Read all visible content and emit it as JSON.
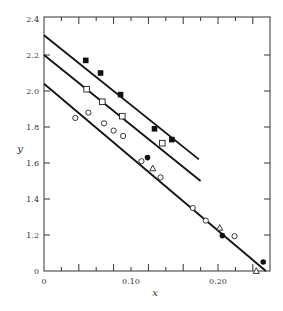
{
  "chart_data": {
    "type": "scatter",
    "title": "",
    "xlabel": "x",
    "ylabel": "y",
    "xlim": [
      0,
      0.26
    ],
    "ylim": [
      0,
      2.4
    ],
    "y_axis_break": {
      "from": 0,
      "to": 1.2,
      "note": "axis jumps from 0 directly to 1.2"
    },
    "grid": false,
    "legend": null,
    "x_ticks": {
      "major_labeled": [
        0,
        0.1,
        0.2
      ],
      "major_labels": [
        "0",
        "0.10",
        "0.20"
      ],
      "major_unlabeled": [
        0.04,
        0.08,
        0.12,
        0.16,
        0.24
      ],
      "minor_step": 0.02
    },
    "y_ticks": {
      "values": [
        0,
        1.2,
        1.4,
        1.6,
        1.8,
        2.0,
        2.2,
        2.4
      ],
      "labels": [
        "0",
        "1.2",
        "1.4",
        "1.6",
        "1.8",
        "2.0",
        "2.2",
        "2.4"
      ]
    },
    "series": [
      {
        "name": "filled-squares",
        "marker": "square-filled",
        "x": [
          0.048,
          0.065,
          0.088,
          0.127,
          0.147
        ],
        "y": [
          2.17,
          2.1,
          1.98,
          1.79,
          1.73
        ]
      },
      {
        "name": "open-squares",
        "marker": "square-open",
        "x": [
          0.049,
          0.067,
          0.09,
          0.136
        ],
        "y": [
          2.01,
          1.94,
          1.86,
          1.71
        ]
      },
      {
        "name": "open-circles",
        "marker": "circle-open",
        "x": [
          0.036,
          0.051,
          0.069,
          0.08,
          0.091,
          0.112,
          0.134,
          0.171,
          0.186,
          0.219
        ],
        "y": [
          1.85,
          1.88,
          1.82,
          1.78,
          1.75,
          1.61,
          1.52,
          1.35,
          1.28,
          1.16
        ]
      },
      {
        "name": "open-triangles",
        "marker": "triangle-open",
        "x": [
          0.125,
          0.202,
          0.244
        ],
        "y": [
          1.57,
          1.24,
          1.0
        ]
      },
      {
        "name": "filled-circles",
        "marker": "circle-filled",
        "x": [
          0.119,
          0.205,
          0.252
        ],
        "y": [
          1.63,
          1.18,
          1.05
        ]
      }
    ],
    "fit_lines": [
      {
        "name": "upper-line",
        "style": "solid-broken",
        "x": [
          0,
          0.178
        ],
        "y": [
          2.31,
          1.62
        ]
      },
      {
        "name": "middle-line",
        "style": "solid-broken",
        "x": [
          0,
          0.18
        ],
        "y": [
          2.2,
          1.5
        ]
      },
      {
        "name": "lower-line",
        "style": "solid",
        "x": [
          0,
          0.255
        ],
        "y": [
          2.04,
          1.0
        ]
      }
    ]
  }
}
